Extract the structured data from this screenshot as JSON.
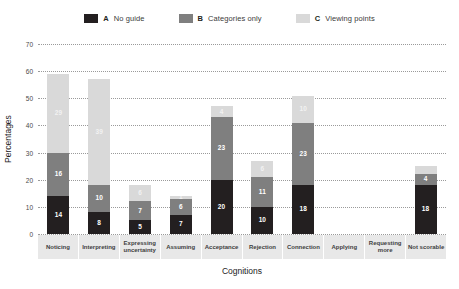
{
  "legend": {
    "items": [
      {
        "key": "A",
        "label": "No guide",
        "color": "#231f20",
        "icon": "legend-swatch-icon"
      },
      {
        "key": "B",
        "label": "Categories only",
        "color": "#7f7f7f",
        "icon": "legend-swatch-icon"
      },
      {
        "key": "C",
        "label": "Viewing points",
        "color": "#d9d9d9",
        "icon": "legend-swatch-icon"
      }
    ]
  },
  "axes": {
    "y_title": "Percentages",
    "x_title": "Cognitions",
    "y_ticks": [
      0,
      10,
      20,
      30,
      40,
      50,
      60,
      70
    ]
  },
  "chart_data": {
    "type": "bar",
    "title": "",
    "subtitle": "",
    "xlabel": "Cognitions",
    "ylabel": "Percentages",
    "ylim": [
      0,
      70
    ],
    "grid": true,
    "stacked": true,
    "legend_position": "top-center",
    "categories": [
      "Noticing",
      "Interpreting",
      "Expressing uncertainty",
      "Assuming",
      "Acceptance",
      "Rejection",
      "Connection",
      "Applying",
      "Requesting more",
      "Not scorable"
    ],
    "series": [
      {
        "name": "A No guide",
        "key": "A",
        "color": "#231f20",
        "values": [
          14,
          8,
          5,
          7,
          20,
          10,
          18,
          0,
          0,
          18
        ],
        "labels": [
          "14",
          "8",
          "5",
          "7",
          "20",
          "10",
          "18",
          "",
          "",
          "18"
        ]
      },
      {
        "name": "B Categories only",
        "key": "B",
        "color": "#7f7f7f",
        "values": [
          16,
          10,
          7,
          6,
          23,
          11,
          23,
          0,
          0,
          4
        ],
        "labels": [
          "16",
          "10",
          "7",
          "6",
          "23",
          "11",
          "23",
          "",
          "",
          "4"
        ]
      },
      {
        "name": "C Viewing points",
        "key": "C",
        "color": "#d9d9d9",
        "values": [
          29,
          39,
          6,
          1,
          4,
          6,
          10,
          0,
          0,
          3
        ],
        "labels": [
          "29",
          "39",
          "6",
          "1",
          "4",
          "6",
          "10",
          "",
          "",
          ""
        ]
      }
    ],
    "totals": [
      59,
      57,
      18,
      14,
      47,
      27,
      51,
      0,
      0,
      25
    ]
  }
}
